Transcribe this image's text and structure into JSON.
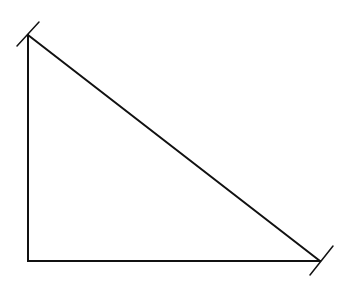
{
  "diagram": {
    "type": "right-triangle",
    "background": "#ffffff",
    "stroke_color": "#111111",
    "stroke_width": 2,
    "vertices": {
      "top": {
        "x": 28,
        "y": 35
      },
      "bottom_left": {
        "x": 28,
        "y": 261
      },
      "bottom_right": {
        "x": 320,
        "y": 261
      }
    },
    "edges": [
      {
        "name": "vertical-leg",
        "from": "top",
        "to": "bottom_left"
      },
      {
        "name": "horizontal-leg",
        "from": "bottom_left",
        "to": "bottom_right"
      },
      {
        "name": "hypotenuse",
        "from": "top",
        "to": "bottom_right"
      }
    ],
    "tick_marks": [
      {
        "name": "top-vertex-tick",
        "x1": 17,
        "y1": 46,
        "x2": 39,
        "y2": 22
      },
      {
        "name": "bottom-right-vertex-tick",
        "x1": 310,
        "y1": 275,
        "x2": 333,
        "y2": 246
      }
    ]
  }
}
